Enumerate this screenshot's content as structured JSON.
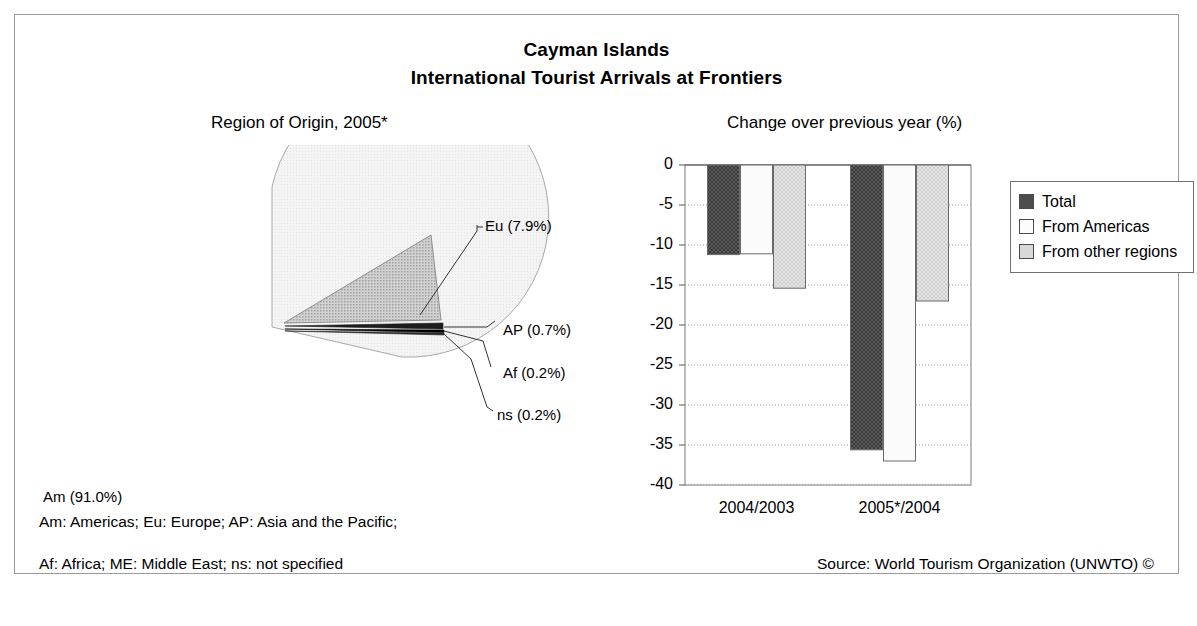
{
  "title": {
    "line1": "Cayman Islands",
    "line2": "International Tourist Arrivals at Frontiers"
  },
  "panels": {
    "pie_heading": "Region of Origin, 2005*",
    "bar_heading": "Change over previous year (%)"
  },
  "footnotes": {
    "line1": "Am: Americas; Eu: Europe; AP: Asia and the Pacific;",
    "line2": "Af: Africa; ME: Middle East; ns: not specified",
    "source": "Source: World Tourism Organization (UNWTO) ©"
  },
  "legend": {
    "items": [
      {
        "label": "Total",
        "color": "#4d4d4d"
      },
      {
        "label": "From Americas",
        "color": "#fcfcfc"
      },
      {
        "label": "From other regions",
        "color": "#d8d8d8"
      }
    ]
  },
  "pie_labels": {
    "am": "Am (91.0%)",
    "eu": "Eu (7.9%)",
    "ap": "AP (0.7%)",
    "af": "Af (0.2%)",
    "ns": "ns (0.2%)"
  },
  "axis": {
    "y_ticks": [
      "0",
      "-5",
      "-10",
      "-15",
      "-20",
      "-25",
      "-30",
      "-35",
      "-40"
    ],
    "x_ticks": [
      "2004/2003",
      "2005*/2004"
    ]
  },
  "chart_data": [
    {
      "type": "pie",
      "title": "Region of Origin, 2005*",
      "categories": [
        "Am",
        "Eu",
        "AP",
        "Af",
        "ns"
      ],
      "category_names": [
        "Americas",
        "Europe",
        "Asia and the Pacific",
        "Africa",
        "not specified"
      ],
      "values": [
        91.0,
        7.9,
        0.7,
        0.2,
        0.2
      ],
      "unit": "%",
      "labels": [
        "Am (91.0%)",
        "Eu (7.9%)",
        "AP (0.7%)",
        "Af (0.2%)",
        "ns (0.2%)"
      ],
      "colors": [
        "#f2f2f2",
        "#b8b8b8",
        "#1a1a1a",
        "#000000",
        "#333333"
      ],
      "exploded": [
        "Eu",
        "AP",
        "Af",
        "ns"
      ]
    },
    {
      "type": "bar",
      "title": "Change over previous year (%)",
      "categories": [
        "2004/2003",
        "2005*/2004"
      ],
      "series": [
        {
          "name": "Total",
          "values": [
            -11.2,
            -35.6
          ],
          "color": "#4d4d4d"
        },
        {
          "name": "From Americas",
          "values": [
            -11.1,
            -37.0
          ],
          "color": "#fcfcfc"
        },
        {
          "name": "From other regions",
          "values": [
            -15.4,
            -17.0
          ],
          "color": "#d8d8d8"
        }
      ],
      "xlabel": "",
      "ylabel": "",
      "ylim": [
        -40,
        0
      ],
      "ytick_step": 5,
      "grid": true,
      "legend_position": "right"
    }
  ]
}
